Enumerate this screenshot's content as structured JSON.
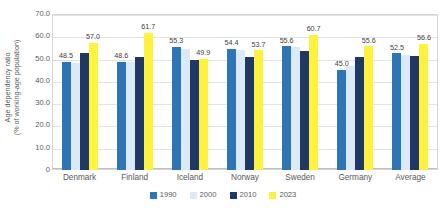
{
  "chart_data": {
    "type": "bar",
    "title": "",
    "xlabel": "",
    "ylabel": "Age dependency ratio (% of working-age population)",
    "ylim": [
      0,
      70
    ],
    "yticks": [
      "0",
      "10.0",
      "20.0",
      "30.0",
      "40.0",
      "50.0",
      "60.0",
      "70.0"
    ],
    "ytick_values": [
      0,
      10,
      20,
      30,
      40,
      50,
      60,
      70
    ],
    "grid": "horizontal",
    "legend_position": "bottom",
    "categories": [
      "Denmark",
      "Finland",
      "Iceland",
      "Norway",
      "Sweden",
      "Germany",
      "Average"
    ],
    "series": [
      {
        "name": "1990",
        "color": "#2E75B6",
        "values": [
          48.5,
          48.6,
          55.3,
          54.4,
          55.6,
          45.0,
          52.5
        ]
      },
      {
        "name": "2000",
        "color": "#DCE9F7",
        "values": [
          47.8,
          48.6,
          54.2,
          53.8,
          55.0,
          46.5,
          51.8
        ]
      },
      {
        "name": "2010",
        "color": "#1F3864",
        "values": [
          52.3,
          50.9,
          49.3,
          50.5,
          53.6,
          50.9,
          51.3
        ]
      },
      {
        "name": "2023",
        "color": "#FFF23F",
        "values": [
          57.0,
          61.7,
          49.9,
          53.7,
          60.7,
          55.6,
          56.6
        ]
      }
    ],
    "data_labels": [
      {
        "series": "1990",
        "values": [
          "48.5",
          "48.6",
          "55.3",
          "54.4",
          "55.6",
          "45.0",
          "52.5"
        ]
      },
      {
        "series": "2023",
        "values": [
          "57.0",
          "61.7",
          "49.9",
          "53.7",
          "60.7",
          "55.6",
          "56.6"
        ]
      }
    ]
  },
  "axis": {
    "y_title_line1": "Age dependency ratio",
    "y_title_line2": "(% of working-age population)"
  }
}
